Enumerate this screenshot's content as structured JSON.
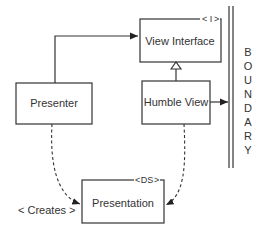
{
  "boxes": {
    "presenter": "Presenter",
    "view_interface": "View Interface",
    "humble_view": "Humble View",
    "presentation": "Presentation"
  },
  "stereotypes": {
    "interface": "I",
    "data_structure": "DS"
  },
  "boundary": [
    "B",
    "O",
    "U",
    "N",
    "D",
    "A",
    "R",
    "Y"
  ],
  "annotations": {
    "creates": "< Creates >"
  }
}
